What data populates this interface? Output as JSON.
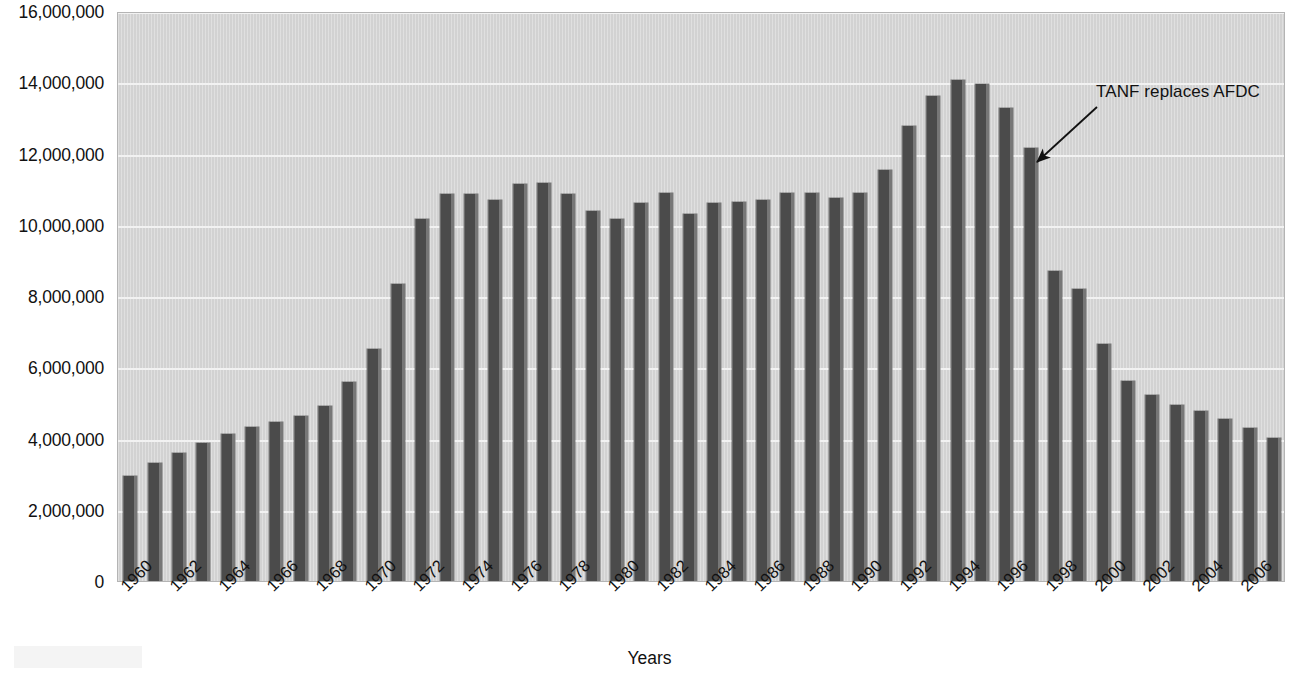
{
  "chart_data": {
    "type": "bar",
    "title": "",
    "subtitle": "",
    "xlabel": "Years",
    "ylabel": "",
    "ylim": [
      0,
      16000000
    ],
    "ytick_step": 2000000,
    "grid": true,
    "legend": null,
    "categories": [
      "1960",
      "1961",
      "1962",
      "1963",
      "1964",
      "1965",
      "1966",
      "1967",
      "1968",
      "1969",
      "1970",
      "1971",
      "1972",
      "1973",
      "1974",
      "1975",
      "1976",
      "1977",
      "1978",
      "1979",
      "1980",
      "1981",
      "1982",
      "1983",
      "1984",
      "1985",
      "1986",
      "1987",
      "1988",
      "1989",
      "1990",
      "1991",
      "1992",
      "1993",
      "1994",
      "1995",
      "1996",
      "1997",
      "1998",
      "1999",
      "2000",
      "2001",
      "2002",
      "2003",
      "2004",
      "2005",
      "2006",
      "2007"
    ],
    "values": [
      2950000,
      3300000,
      3600000,
      3870000,
      4120000,
      4320000,
      4450000,
      4620000,
      4900000,
      5600000,
      6500000,
      8350000,
      10150000,
      10850000,
      10850000,
      10700000,
      11150000,
      11180000,
      10870000,
      10400000,
      10170000,
      10600000,
      10900000,
      10300000,
      10600000,
      10650000,
      10700000,
      10900000,
      10880000,
      10760000,
      10880000,
      11540000,
      12770000,
      13620000,
      14050000,
      13960000,
      13280000,
      12150000,
      8700000,
      8200000,
      6640000,
      5620000,
      5220000,
      4930000,
      4760000,
      4550000,
      4300000,
      4020000
    ],
    "tick_labels_shown": [
      "1960",
      "1962",
      "1964",
      "1966",
      "1968",
      "1970",
      "1972",
      "1974",
      "1976",
      "1978",
      "1980",
      "1982",
      "1984",
      "1986",
      "1988",
      "1990",
      "1992",
      "1994",
      "1996",
      "1998",
      "2000",
      "2002",
      "2004",
      "2006"
    ],
    "ytick_labels": [
      "0",
      "2,000,000",
      "4,000,000",
      "6,000,000",
      "8,000,000",
      "10,000,000",
      "12,000,000",
      "14,000,000",
      "16,000,000"
    ],
    "annotations": [
      {
        "text": "TANF replaces AFDC",
        "points_to_category": "1997"
      }
    ],
    "colors": {
      "bar": "#4b4b4b",
      "bar_highlight": "#777777",
      "plot_background": "#d2d2d2",
      "gridline": "#f2f2f2",
      "text": "#111111",
      "page_background": "#ffffff"
    }
  }
}
